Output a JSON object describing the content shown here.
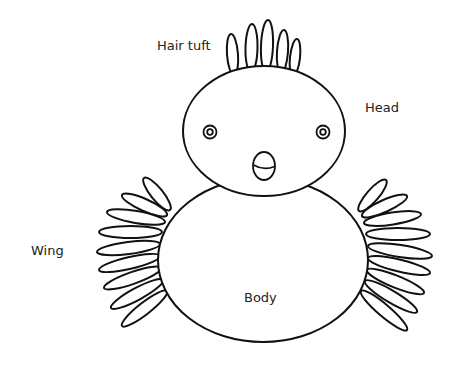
{
  "diagram": {
    "colors": {
      "line": "#111111",
      "fill": "#ffffff",
      "text": "#222222"
    },
    "labels": [
      {
        "id": "hair-tuft",
        "text": "Hair tuft",
        "x": 157,
        "y": 50
      },
      {
        "id": "head",
        "text": "Head",
        "x": 365,
        "y": 112
      },
      {
        "id": "wing",
        "text": "Wing",
        "x": 31,
        "y": 255
      },
      {
        "id": "body",
        "text": "Body",
        "x": 244,
        "y": 302
      }
    ],
    "parts": {
      "body": {
        "cx": 263,
        "cy": 260,
        "rx": 105,
        "ry": 82
      },
      "head": {
        "cx": 264,
        "cy": 131,
        "rx": 81,
        "ry": 65
      },
      "eyes": [
        {
          "cx": 210,
          "cy": 132,
          "r_outer": 6.5,
          "r_inner": 2.8
        },
        {
          "cx": 323,
          "cy": 132,
          "r_outer": 6.5,
          "r_inner": 2.8
        }
      ],
      "beak": {
        "cx": 264,
        "cy": 166,
        "rx": 11,
        "ry": 14
      },
      "hair_tuft": [
        {
          "bx": 234,
          "by": 69,
          "tx": 231,
          "ty": 34,
          "w": 11
        },
        {
          "bx": 251,
          "by": 66,
          "tx": 252,
          "ty": 24,
          "w": 12
        },
        {
          "bx": 266,
          "by": 66,
          "tx": 268,
          "ty": 20,
          "w": 12
        },
        {
          "bx": 281,
          "by": 67,
          "tx": 284,
          "ty": 30,
          "w": 11
        },
        {
          "bx": 293,
          "by": 70,
          "tx": 297,
          "ty": 39,
          "w": 10
        }
      ],
      "left_wing": [
        {
          "bx": 170,
          "by": 210,
          "tx": 144,
          "ty": 178
        },
        {
          "bx": 167,
          "by": 215,
          "tx": 122,
          "ty": 195
        },
        {
          "bx": 165,
          "by": 222,
          "tx": 107,
          "ty": 212
        },
        {
          "bx": 162,
          "by": 232,
          "tx": 99,
          "ty": 232
        },
        {
          "bx": 160,
          "by": 244,
          "tx": 97,
          "ty": 252
        },
        {
          "bx": 160,
          "by": 256,
          "tx": 99,
          "ty": 270
        },
        {
          "bx": 161,
          "by": 268,
          "tx": 104,
          "ty": 288
        },
        {
          "bx": 163,
          "by": 280,
          "tx": 111,
          "ty": 308
        },
        {
          "bx": 167,
          "by": 291,
          "tx": 122,
          "ty": 326
        }
      ],
      "right_wing": [
        {
          "bx": 359,
          "by": 211,
          "tx": 386,
          "ty": 180
        },
        {
          "bx": 362,
          "by": 216,
          "tx": 407,
          "ty": 196
        },
        {
          "bx": 364,
          "by": 223,
          "tx": 421,
          "ty": 214
        },
        {
          "bx": 366,
          "by": 234,
          "tx": 430,
          "ty": 234
        },
        {
          "bx": 368,
          "by": 246,
          "tx": 432,
          "ty": 256
        },
        {
          "bx": 368,
          "by": 258,
          "tx": 430,
          "ty": 273
        },
        {
          "bx": 367,
          "by": 270,
          "tx": 424,
          "ty": 293
        },
        {
          "bx": 365,
          "by": 281,
          "tx": 417,
          "ty": 312
        },
        {
          "bx": 361,
          "by": 291,
          "tx": 407,
          "ty": 330
        }
      ]
    }
  }
}
